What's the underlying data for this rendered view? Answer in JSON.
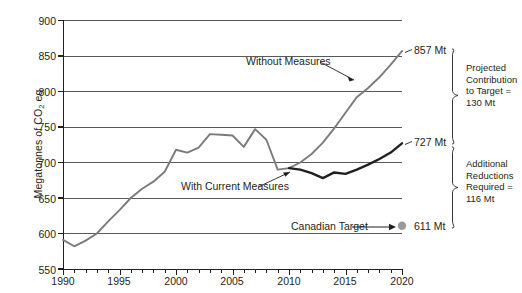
{
  "chart_data": {
    "type": "line",
    "title": "",
    "xlabel": "",
    "ylabel": "Megatonnes of CO2 eq",
    "ylabel_main": "Megatonnes of CO",
    "ylabel_sub": "2",
    "ylabel_tail": " eq",
    "xlim": [
      1990,
      2020
    ],
    "ylim": [
      550,
      900
    ],
    "y_ticks": [
      900,
      850,
      800,
      750,
      700,
      650,
      600,
      550
    ],
    "x_ticks": [
      1990,
      1995,
      2000,
      2005,
      2010,
      2015,
      2020
    ],
    "x_minor_tick_step": 1,
    "grid": "horizontal",
    "legend": "inline-annotations",
    "series": [
      {
        "name": "Without Measures",
        "color": "#7b7b7b",
        "x": [
          1990,
          1991,
          1992,
          1993,
          1994,
          1995,
          1996,
          1997,
          1998,
          1999,
          2000,
          2001,
          2002,
          2003,
          2004,
          2005,
          2006,
          2007,
          2008,
          2009,
          2010,
          2011,
          2012,
          2013,
          2014,
          2015,
          2016,
          2017,
          2018,
          2019,
          2020
        ],
        "values": [
          591,
          582,
          590,
          600,
          617,
          633,
          650,
          663,
          673,
          687,
          718,
          714,
          721,
          740,
          739,
          738,
          722,
          747,
          732,
          690,
          692,
          700,
          712,
          728,
          748,
          770,
          792,
          805,
          820,
          838,
          857
        ]
      },
      {
        "name": "With Current Measures",
        "color": "#231f20",
        "x": [
          2010,
          2011,
          2012,
          2013,
          2014,
          2015,
          2016,
          2017,
          2018,
          2019,
          2020
        ],
        "values": [
          692,
          690,
          685,
          678,
          686,
          684,
          690,
          697,
          705,
          714,
          727
        ]
      }
    ],
    "markers": [
      {
        "name": "Canadian Target",
        "x": 2020,
        "value": 611,
        "color": "#9a9a9a",
        "label": "Canadian Target"
      }
    ],
    "annotations": [
      {
        "name": "without-measures",
        "text": "Without Measures"
      },
      {
        "name": "with-current-measures",
        "text": "With Current Measures"
      },
      {
        "name": "canadian-target",
        "text": "Canadian Target"
      }
    ],
    "end_labels": [
      {
        "name": "without-measures-end",
        "text": "857 Mt",
        "value": 857
      },
      {
        "name": "with-current-measures-end",
        "text": "727 Mt",
        "value": 727
      },
      {
        "name": "canadian-target-end",
        "text": "611 Mt",
        "value": 611
      }
    ],
    "brackets": [
      {
        "name": "projected-contribution",
        "from": 857,
        "to": 727,
        "lines": [
          "Projected",
          "Contribution",
          "to Target =",
          "130 Mt"
        ],
        "amount": "130 Mt"
      },
      {
        "name": "additional-reductions",
        "from": 727,
        "to": 611,
        "lines": [
          "Additional",
          "Reductions",
          "Required =",
          "116 Mt"
        ],
        "amount": "116 Mt"
      }
    ]
  },
  "axis": {
    "y_labels": [
      "900",
      "850",
      "800",
      "750",
      "700",
      "650",
      "600",
      "550"
    ],
    "x_labels": [
      "1990",
      "1995",
      "2000",
      "2005",
      "2010",
      "2015",
      "2020"
    ]
  },
  "labels": {
    "y_title_main": "Megatonnes of CO",
    "y_title_sub": "2",
    "y_title_tail": " eq",
    "without_measures": "Without Measures",
    "with_current_measures": "With Current Measures",
    "canadian_target": "Canadian Target",
    "end_857": "857 Mt",
    "end_727": "727 Mt",
    "end_611": "611 Mt",
    "bracket1_l1": "Projected",
    "bracket1_l2": "Contribution",
    "bracket1_l3": "to Target =",
    "bracket1_l4": "130 Mt",
    "bracket2_l1": "Additional",
    "bracket2_l2": "Reductions",
    "bracket2_l3": "Required =",
    "bracket2_l4": "116 Mt"
  },
  "colors": {
    "without_measures_line": "#7b7b7b",
    "with_measures_line": "#231f20",
    "target_dot": "#9a9a9a",
    "gridline": "#58595b",
    "axis": "#231f20",
    "text": "#231f20",
    "background": "#ffffff"
  }
}
